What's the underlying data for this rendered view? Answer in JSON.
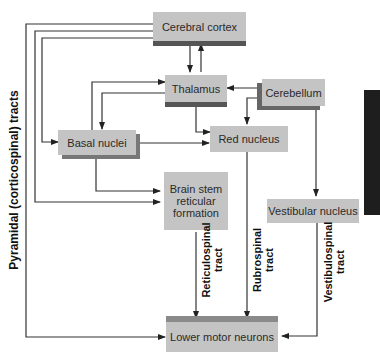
{
  "diagram": {
    "nodes": {
      "cerebral_cortex": "Cerebral cortex",
      "thalamus": "Thalamus",
      "cerebellum": "Cerebellum",
      "basal_nuclei": "Basal nuclei",
      "red_nucleus": "Red nucleus",
      "brain_stem_line1": "Brain stem",
      "brain_stem_line2": "reticular",
      "brain_stem_line3": "formation",
      "vestibular_nucleus": "Vestibular nucleus",
      "lower_motor_neurons": "Lower motor neurons"
    },
    "tracts": {
      "pyramidal": "Pyramidal (corticospinal) tracts",
      "reticulospinal_line1": "Reticulospinal",
      "reticulospinal_line2": "tract",
      "rubrospinal_line1": "Rubrospinal",
      "rubrospinal_line2": "tract",
      "vestibulospinal_line1": "Vestibulospinal",
      "vestibulospinal_line2": "tract"
    },
    "edges": [
      {
        "from": "Cerebral cortex",
        "to": "Thalamus"
      },
      {
        "from": "Thalamus",
        "to": "Cerebral cortex"
      },
      {
        "from": "Cerebral cortex",
        "to": "Basal nuclei"
      },
      {
        "from": "Cerebral cortex",
        "to": "Brain stem reticular formation"
      },
      {
        "from": "Cerebral cortex",
        "to": "Lower motor neurons",
        "label": "Pyramidal (corticospinal) tracts"
      },
      {
        "from": "Basal nuclei",
        "to": "Thalamus"
      },
      {
        "from": "Thalamus",
        "to": "Basal nuclei"
      },
      {
        "from": "Thalamus",
        "to": "Red nucleus"
      },
      {
        "from": "Cerebellum",
        "to": "Thalamus"
      },
      {
        "from": "Cerebellum",
        "to": "Red nucleus"
      },
      {
        "from": "Cerebellum",
        "to": "Vestibular nucleus"
      },
      {
        "from": "Basal nuclei",
        "to": "Red nucleus"
      },
      {
        "from": "Basal nuclei",
        "to": "Brain stem reticular formation"
      },
      {
        "from": "Brain stem reticular formation",
        "to": "Lower motor neurons",
        "label": "Reticulospinal tract"
      },
      {
        "from": "Red nucleus",
        "to": "Lower motor neurons",
        "label": "Rubrospinal tract"
      },
      {
        "from": "Vestibular nucleus",
        "to": "Lower motor neurons",
        "label": "Vestibulospinal tract"
      }
    ]
  }
}
